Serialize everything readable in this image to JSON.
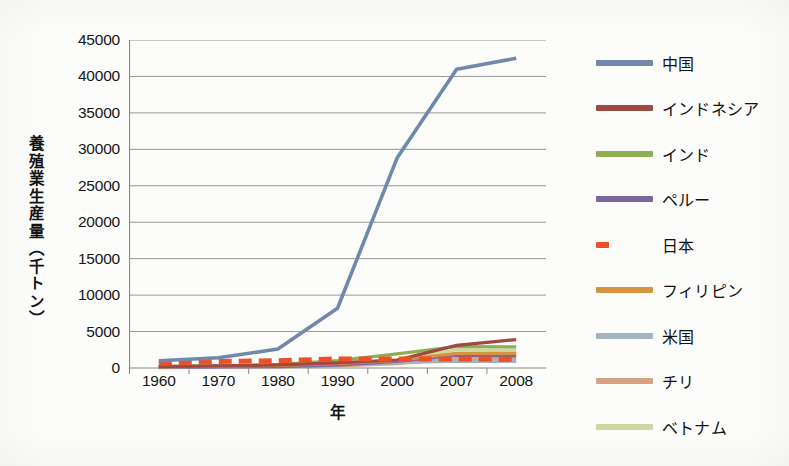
{
  "chart_data": {
    "type": "line",
    "title": "",
    "xlabel": "年",
    "ylabel": "養殖業生産量（千トン）",
    "categories": [
      "1960",
      "1970",
      "1980",
      "1990",
      "2000",
      "2007",
      "2008"
    ],
    "ylim": [
      0,
      45000
    ],
    "ytick_labels": [
      "0",
      "5000",
      "10000",
      "15000",
      "20000",
      "25000",
      "30000",
      "35000",
      "40000",
      "45000"
    ],
    "ytick_values": [
      0,
      5000,
      10000,
      15000,
      20000,
      25000,
      30000,
      35000,
      40000,
      45000
    ],
    "grid": "horizontal",
    "legend_position": "right",
    "series": [
      {
        "name": "中国",
        "color": "#7089ab",
        "style": "solid",
        "values": [
          1000,
          1400,
          2600,
          8200,
          28800,
          41000,
          42500
        ]
      },
      {
        "name": "インドネシア",
        "color": "#9e4a41",
        "style": "solid",
        "values": [
          200,
          280,
          420,
          700,
          1100,
          3100,
          3900
        ]
      },
      {
        "name": "インド",
        "color": "#8eae52",
        "style": "solid",
        "values": [
          180,
          300,
          450,
          1000,
          1950,
          2950,
          2900
        ]
      },
      {
        "name": "ペルー",
        "color": "#7e66a0",
        "style": "solid",
        "values": [
          100,
          150,
          200,
          400,
          900,
          1750,
          1650
        ]
      },
      {
        "name": "日本",
        "color": "#f04f26",
        "style": "dashed",
        "values": [
          620,
          900,
          1000,
          1250,
          1250,
          1250,
          1200
        ]
      },
      {
        "name": "フィリピン",
        "color": "#d79440",
        "style": "solid",
        "values": [
          150,
          250,
          350,
          600,
          1050,
          2000,
          2000
        ]
      },
      {
        "name": "米国",
        "color": "#a3b3bf",
        "style": "solid",
        "values": [
          120,
          200,
          300,
          450,
          750,
          950,
          900
        ]
      },
      {
        "name": "チリ",
        "color": "#d9a183",
        "style": "solid",
        "values": [
          60,
          100,
          160,
          300,
          600,
          1300,
          1250
        ]
      },
      {
        "name": "ベトナム",
        "color": "#ccd8a0",
        "style": "solid",
        "values": [
          80,
          150,
          250,
          500,
          1100,
          2500,
          2450
        ]
      }
    ]
  },
  "axis": {
    "x_title": "年",
    "y_title": "養殖業生産量（千トン）"
  },
  "colors": {
    "grid": "#8c8c84",
    "axis": "#8c8c84",
    "text": "#161616",
    "background": "#fcfcfa"
  }
}
